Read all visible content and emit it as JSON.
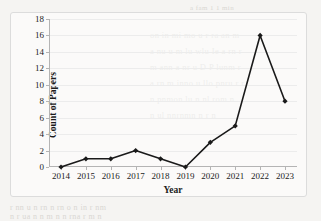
{
  "chart_data": {
    "type": "line",
    "title": "",
    "xlabel": "Year",
    "ylabel": "Count of Papers",
    "categories": [
      "2014",
      "2015",
      "2016",
      "2017",
      "2018",
      "2019",
      "2020",
      "2021",
      "2022",
      "2023"
    ],
    "values": [
      0,
      1,
      1,
      2,
      1,
      0,
      3,
      5,
      16,
      8
    ],
    "series": [
      {
        "name": "Count of Papers",
        "values": [
          0,
          1,
          1,
          2,
          1,
          0,
          3,
          5,
          16,
          8
        ]
      }
    ],
    "ylim": [
      0,
      18
    ],
    "ytick_step": 2,
    "yticks": [
      0,
      2,
      4,
      6,
      8,
      10,
      12,
      14,
      16,
      18
    ],
    "ytick_labels": [
      "0",
      "2",
      "4",
      "6",
      "8",
      "10",
      "12",
      "14",
      "16",
      "18"
    ],
    "grid": true,
    "grid_axis": "y",
    "legend": false,
    "legend_position": "none",
    "marker": "diamond",
    "line_color": "#1a1a1a",
    "marker_color": "#1a1a1a",
    "grid_color": "#ececec",
    "axis_color": "#b4b4b4"
  },
  "page": {
    "background_color": "#f5f4f2",
    "frame_color": "#dcdcdc",
    "showthrough_color": "#d9d7d3",
    "showthrough_lines": [
      "a fam 1 1 min",
      "on in mi  mo  u r ra an  m",
      "a nu u m  lu  wlu Ie a  rn r",
      "m ann a  nr  u  D  P   lunm r",
      "a rn  m inno  u  llo pnru r  r",
      "n  pnmon   lu  n nl  rom    n",
      "n   ul  nnrnmn n   r  n",
      "r nn  u  n rn  n  rn o n in  r  nm",
      "n r  ua n  n  m  n n rna  r  m n"
    ]
  }
}
